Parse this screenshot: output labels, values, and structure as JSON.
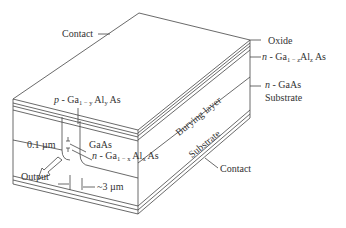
{
  "diagram": {
    "labels": {
      "contact_top": "Contact",
      "oxide": "Oxide",
      "n_GaAlAs_top": {
        "prefix": "n",
        "text": " - Ga",
        "sub1": "1 − z",
        "mid": "Al",
        "sub2": "z",
        "suffix": " As"
      },
      "n_GaAs": {
        "prefix": "n",
        "text": " - GaAs"
      },
      "substrate_right": "Substrate",
      "p_GaAlAs": {
        "prefix": "p",
        "text": " - Ga",
        "sub1": "1 − y",
        "mid": " Al",
        "sub2": "y",
        "suffix": " As"
      },
      "burying_layer": "Burying layer",
      "substrate_side": "Substrate",
      "thickness": "0.1 µm",
      "gaas_active": "GaAs",
      "n_GaAlAs_bottom": {
        "prefix": "n",
        "text": " - Ga",
        "sub1": "1 − x",
        "mid": " Al",
        "sub2": "x",
        "suffix": " As"
      },
      "output": "Output",
      "width": "~3 µm",
      "contact_bottom": "Contact"
    },
    "colors": {
      "line": "#444444",
      "text": "#333333",
      "background": "#ffffff"
    }
  }
}
